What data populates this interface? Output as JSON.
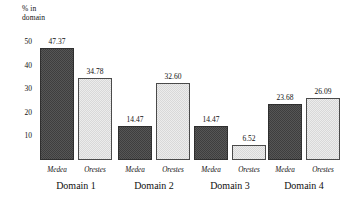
{
  "chart_data": {
    "type": "bar",
    "title": "",
    "subtitle": "",
    "xlabel": "",
    "ylabel": "% in\ndomain",
    "ylabel_lines": [
      "% in",
      "domain"
    ],
    "ylim": [
      0,
      52
    ],
    "yticks": [
      10,
      20,
      30,
      40,
      50
    ],
    "ytick_labels": [
      "10",
      "20",
      "30",
      "40",
      "50"
    ],
    "grid": false,
    "legend": "none",
    "categories": [
      "Domain 1",
      "Domain 2",
      "Domain 3",
      "Domain 4"
    ],
    "series": [
      {
        "name": "Medea",
        "style": "dark-checker",
        "color": "#3e3e3e",
        "values": [
          47.37,
          34.78,
          14.47,
          14.47
        ],
        "value_labels": [
          "47.37",
          "34.78",
          "14.47",
          "14.47"
        ]
      },
      {
        "name": "Orestes",
        "style": "light-checker",
        "color": "#ececec",
        "values": [
          34.78,
          32.6,
          6.52,
          26.09
        ],
        "value_labels": [
          "34.78",
          "32.60",
          "6.52",
          "26.09"
        ]
      }
    ],
    "groups": [
      {
        "category": "Domain 1",
        "bars": [
          {
            "series": "Medea",
            "value": 47.37,
            "label": "47.37",
            "style": "dark"
          },
          {
            "series": "Orestes",
            "value": 34.78,
            "label": "34.78",
            "style": "light"
          }
        ]
      },
      {
        "category": "Domain 2",
        "bars": [
          {
            "series": "Medea",
            "value": 14.47,
            "label": "14.47",
            "style": "dark"
          },
          {
            "series": "Orestes",
            "value": 32.6,
            "label": "32.60",
            "style": "light"
          }
        ]
      },
      {
        "category": "Domain 3",
        "bars": [
          {
            "series": "Medea",
            "value": 14.47,
            "label": "14.47",
            "style": "dark"
          },
          {
            "series": "Orestes",
            "value": 6.52,
            "label": "6.52",
            "style": "light"
          }
        ]
      },
      {
        "category": "Domain 4",
        "bars": [
          {
            "series": "Medea",
            "value": 23.68,
            "label": "23.68",
            "style": "dark"
          },
          {
            "series": "Orestes",
            "value": 26.09,
            "label": "26.09",
            "style": "light"
          }
        ]
      }
    ]
  }
}
